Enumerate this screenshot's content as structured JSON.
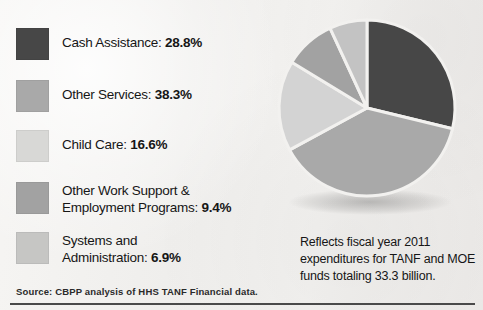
{
  "chart_data": {
    "type": "pie",
    "title": "",
    "categories": [
      "Cash Assistance",
      "Other Services",
      "Child Care",
      "Other Work Support & Employment Programs",
      "Systems and Administration"
    ],
    "values": [
      28.8,
      38.3,
      16.6,
      9.4,
      6.9
    ],
    "value_labels": [
      "28.8%",
      "38.3%",
      "16.6%",
      "9.4%",
      "6.9%"
    ],
    "colors": [
      "#474747",
      "#a9a9a9",
      "#d3d3d3",
      "#a2a2a2",
      "#c3c3c3"
    ],
    "units": "percent",
    "start_angle_deg": 0,
    "direction": "clockwise",
    "legend_position": "left",
    "grid": false,
    "slice_separator_color": "#f2f1ef",
    "total_label": "33.3 billion",
    "fiscal_year": "2011"
  },
  "legend": {
    "items": [
      {
        "label": "Cash Assistance:",
        "value": "28.8%",
        "swatch_color": "#474747",
        "swatch_name": "legend-swatch-cash-assistance"
      },
      {
        "label": "Other Services:",
        "value": "38.3%",
        "swatch_color": "#a9a9a9",
        "swatch_name": "legend-swatch-other-services"
      },
      {
        "label": "Child Care:",
        "value": "16.6%",
        "swatch_color": "#d8d8d6",
        "swatch_name": "legend-swatch-child-care"
      },
      {
        "label": "Other Work Support &\nEmployment Programs:",
        "value": "9.4%",
        "swatch_color": "#a2a2a2",
        "swatch_name": "legend-swatch-other-work-support"
      },
      {
        "label": "Systems and\nAdministration:",
        "value": "6.9%",
        "swatch_color": "#c6c6c4",
        "swatch_name": "legend-swatch-systems-administration"
      }
    ]
  },
  "caption": {
    "text": "Reflects fiscal year 2011\nexpenditures for TANF and MOE\nfunds totaling 33.3 billion."
  },
  "source": {
    "text": "Source: CBPP analysis of HHS TANF Financial data."
  }
}
